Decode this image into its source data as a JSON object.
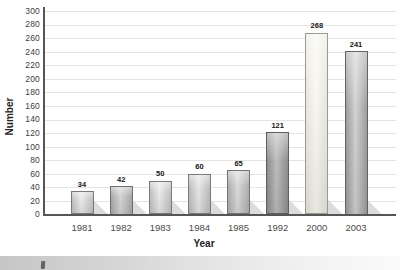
{
  "chart_data": {
    "type": "bar",
    "title": "",
    "xlabel": "Year",
    "ylabel": "Number",
    "categories": [
      "1981",
      "1982",
      "1983",
      "1984",
      "1985",
      "1992",
      "2000",
      "2003"
    ],
    "values": [
      34,
      42,
      50,
      60,
      65,
      121,
      268,
      241
    ],
    "ylim": [
      0,
      300
    ],
    "ytick_step": 20,
    "grid": true,
    "legend_position": "none",
    "value_labels_shown": true,
    "bar_fills": [
      {
        "edge": "#c0c0c0",
        "mid": "#e9e9e9",
        "border": "#7a7a7a"
      },
      {
        "edge": "#a8a8a8",
        "mid": "#d4d4d4",
        "border": "#6f6f6f"
      },
      {
        "edge": "#c0c0c0",
        "mid": "#e9e9e9",
        "border": "#7a7a7a"
      },
      {
        "edge": "#bbbbbb",
        "mid": "#e5e5e5",
        "border": "#7a7a7a"
      },
      {
        "edge": "#aeaeae",
        "mid": "#dadada",
        "border": "#737373"
      },
      {
        "edge": "#8e8e8e",
        "mid": "#bdbdbd",
        "border": "#5f5f5f"
      },
      {
        "edge": "#e8e7dd",
        "mid": "#f8f7f1",
        "border": "#9a9a92"
      },
      {
        "edge": "#9d9d9d",
        "mid": "#d2d2d2",
        "border": "#636363"
      }
    ],
    "colors": {
      "axis": "#565656",
      "gridline": "#e4e4e4",
      "tick_text": "#3e3e3e",
      "value_text": "#161616",
      "shadow": "#dcdcdc",
      "background": "#ffffff"
    }
  }
}
